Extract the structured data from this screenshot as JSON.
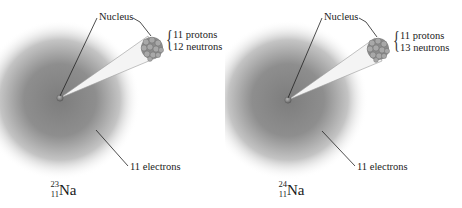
{
  "diagram": {
    "type": "isotope comparison",
    "panels": [
      {
        "nucleus_label": "Nucleus",
        "protons": "11 protons",
        "neutrons": "12 neutrons",
        "electrons": "11 electrons",
        "isotope": {
          "mass_number": "23",
          "atomic_number": "11",
          "symbol": "Na"
        }
      },
      {
        "nucleus_label": "Nucleus",
        "protons": "11 protons",
        "neutrons": "13 neutrons",
        "electrons": "11 electrons",
        "isotope": {
          "mass_number": "24",
          "atomic_number": "11",
          "symbol": "Na"
        }
      }
    ],
    "colors": {
      "cloud_center": "#7a7a7a",
      "cloud_edge": "#ffffff",
      "nucleus": "#8c8c8c",
      "leader_line": "#222222"
    }
  }
}
